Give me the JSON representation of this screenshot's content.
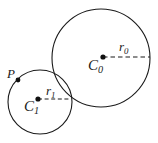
{
  "figure": {
    "background_color": "#ffffff",
    "stroke_color": "#1a1a1a",
    "labels": {
      "center_large": "C",
      "center_large_sub": "0",
      "radius_large": "r",
      "radius_large_sub": "0",
      "center_small": "C",
      "center_small_sub": "1",
      "radius_small": "r",
      "radius_small_sub": "1",
      "point_p": "P"
    },
    "shapes": {
      "large_circle": {
        "cx": 101,
        "cy": 58,
        "r": 49
      },
      "small_circle": {
        "cx": 40,
        "cy": 102,
        "r": 32
      },
      "large_center_dot": {
        "cx": 103,
        "cy": 57,
        "r": 2.6
      },
      "small_center_dot": {
        "cx": 38,
        "cy": 99,
        "r": 2.6
      },
      "point_p_dot": {
        "cx": 18,
        "cy": 80,
        "r": 2.4
      },
      "radius_large_line": {
        "x1": 103,
        "y1": 57,
        "x2": 150,
        "y2": 57
      },
      "radius_small_line": {
        "x1": 38,
        "y1": 99,
        "x2": 71,
        "y2": 99
      }
    }
  }
}
